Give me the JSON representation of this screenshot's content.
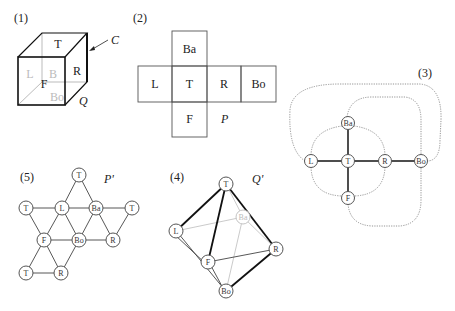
{
  "panels": {
    "p1": {
      "label": "(1)",
      "name_label": "Q",
      "arrow_label": "C",
      "faces": {
        "top": "T",
        "left": "L",
        "back": "B",
        "right": "R",
        "front": "F",
        "bottom": "Bo"
      }
    },
    "p2": {
      "label": "(2)",
      "name_label": "P",
      "cells": [
        {
          "id": "Ba",
          "text": "Ba",
          "col": 1,
          "row": 0
        },
        {
          "id": "L",
          "text": "L",
          "col": 0,
          "row": 1
        },
        {
          "id": "T",
          "text": "T",
          "col": 1,
          "row": 1
        },
        {
          "id": "R",
          "text": "R",
          "col": 2,
          "row": 1
        },
        {
          "id": "Bo",
          "text": "Bo",
          "col": 3,
          "row": 1
        },
        {
          "id": "F",
          "text": "F",
          "col": 1,
          "row": 2
        }
      ]
    },
    "p3": {
      "label": "(3)",
      "nodes": {
        "Ba": "Ba",
        "L": "L",
        "T": "T",
        "R": "R",
        "Bo": "Bo",
        "F": "F"
      }
    },
    "p4": {
      "label": "(4)",
      "name_label": "Q'",
      "nodes": {
        "T": "T",
        "Ba": "Ba",
        "L": "L",
        "F": "F",
        "R": "R",
        "Bo": "Bo"
      }
    },
    "p5": {
      "label": "(5)",
      "name_label": "P'",
      "nodes": {
        "t_top": "T",
        "t_left": "T",
        "l": "L",
        "ba": "Ba",
        "t_right": "T",
        "f": "F",
        "bo": "Bo",
        "r": "R",
        "t_bottom": "T",
        "r_bottom": "R"
      }
    }
  },
  "colors": {
    "ink": "#222222",
    "faint": "#bdbdbd",
    "dotted": "#888888"
  }
}
